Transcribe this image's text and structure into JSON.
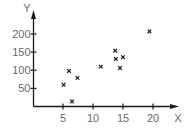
{
  "chart_data": {
    "type": "scatter",
    "title": "",
    "xlabel": "X",
    "ylabel": "Y",
    "xlim": [
      0,
      23.5
    ],
    "ylim": [
      0,
      225
    ],
    "x_ticks": [
      5,
      10,
      15,
      20
    ],
    "y_ticks": [
      50,
      100,
      150,
      200
    ],
    "grid": false,
    "legend": null,
    "marker": "x",
    "colors": {
      "axis": "#1a1a1a",
      "marker": "#1a1a1a",
      "text": "#6a6a6a"
    },
    "series": [
      {
        "name": "data",
        "points": [
          {
            "x": 5.1,
            "y": 60
          },
          {
            "x": 6.0,
            "y": 98
          },
          {
            "x": 6.5,
            "y": 14
          },
          {
            "x": 7.4,
            "y": 79
          },
          {
            "x": 11.3,
            "y": 110
          },
          {
            "x": 13.7,
            "y": 154
          },
          {
            "x": 13.8,
            "y": 131
          },
          {
            "x": 14.5,
            "y": 106
          },
          {
            "x": 15.0,
            "y": 136
          },
          {
            "x": 19.4,
            "y": 207
          }
        ]
      }
    ]
  }
}
